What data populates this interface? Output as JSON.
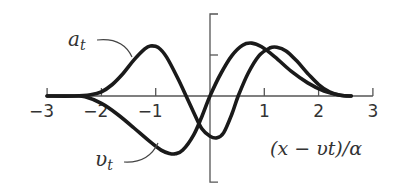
{
  "chart_data": {
    "type": "line",
    "title": "",
    "xlabel": "(x − υt)/α",
    "ylabel": "",
    "xlim": [
      -3,
      3
    ],
    "ylim": [
      -2.1,
      2.0
    ],
    "x_ticks": [
      -3,
      -2,
      -1,
      1,
      2,
      3
    ],
    "x_tick_labels": [
      "−3",
      "−2",
      "−1",
      "1",
      "2",
      "3"
    ],
    "y_ticks": [
      1
    ],
    "grid": false,
    "legend": "inline labels with leader lines",
    "series": [
      {
        "name": "a_t",
        "label": "a",
        "subscript": "t",
        "x": [
          -3.0,
          -2.5,
          -2.2,
          -2.0,
          -1.8,
          -1.6,
          -1.4,
          -1.2,
          -1.1,
          -0.95,
          -0.8,
          -0.6,
          -0.44,
          -0.3,
          -0.15,
          0.0,
          0.13,
          0.25,
          0.4,
          0.52,
          0.7,
          0.9,
          1.1,
          1.23,
          1.4,
          1.6,
          1.8,
          2.0,
          2.2,
          2.4,
          2.6
        ],
        "values": [
          0.0,
          0.0,
          0.03,
          0.1,
          0.28,
          0.55,
          0.88,
          1.15,
          1.22,
          1.18,
          0.95,
          0.45,
          0.0,
          -0.4,
          -0.8,
          -0.98,
          -1.02,
          -0.9,
          -0.45,
          0.0,
          0.55,
          0.98,
          1.17,
          1.19,
          1.1,
          0.85,
          0.55,
          0.28,
          0.1,
          0.02,
          0.0
        ]
      },
      {
        "name": "v_t",
        "label": "υ",
        "subscript": "t",
        "x": [
          -3.0,
          -2.5,
          -2.3,
          -2.0,
          -1.7,
          -1.4,
          -1.1,
          -0.9,
          -0.75,
          -0.64,
          -0.5,
          -0.3,
          -0.15,
          0.0,
          0.2,
          0.4,
          0.6,
          0.77,
          0.95,
          1.2,
          1.5,
          1.8,
          2.1,
          2.4,
          2.6
        ],
        "values": [
          0.0,
          0.0,
          -0.02,
          -0.18,
          -0.45,
          -0.78,
          -1.12,
          -1.32,
          -1.4,
          -1.41,
          -1.32,
          -0.95,
          -0.5,
          0.0,
          0.55,
          0.98,
          1.24,
          1.29,
          1.2,
          0.95,
          0.6,
          0.32,
          0.12,
          0.02,
          0.0
        ]
      }
    ]
  },
  "labels": {
    "a_main": "a",
    "a_sub": "t",
    "v_main": "υ",
    "v_sub": "t",
    "x_axis": "(x − υt)/α"
  }
}
